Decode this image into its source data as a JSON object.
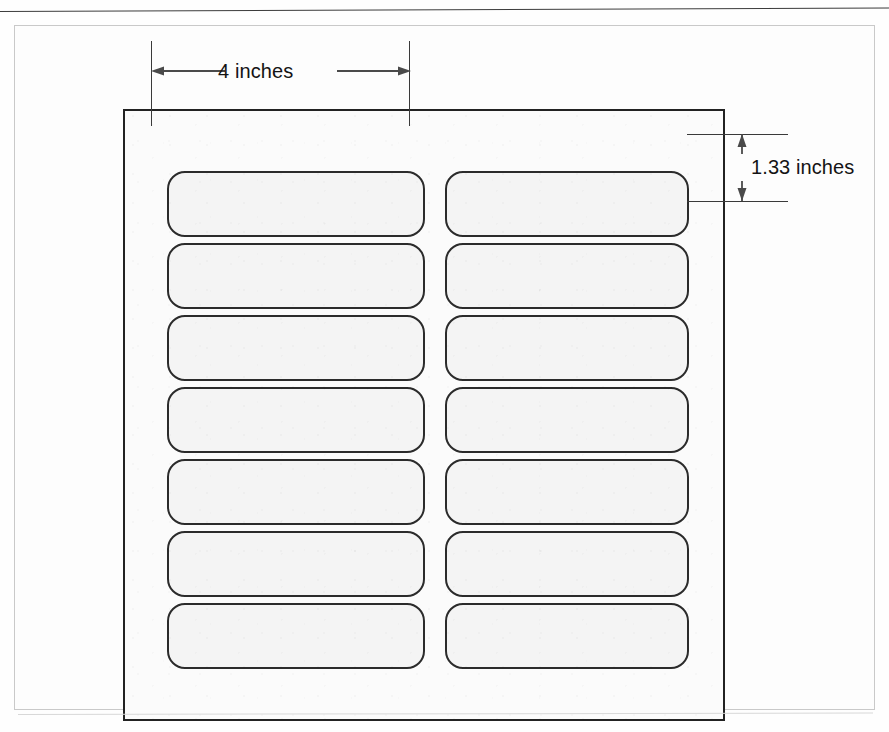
{
  "figure": {
    "kind": "label-sheet-dimension-diagram",
    "cropped_header_text": "",
    "sheet": {
      "columns": 2,
      "rows": 7,
      "total_labels": 14
    }
  },
  "dimensions": {
    "width": {
      "id": "label-width",
      "text": "4 inches",
      "value": 4,
      "unit": "inches",
      "orientation": "horizontal"
    },
    "height": {
      "id": "label-height",
      "text": "1.33 inches",
      "value": 1.33,
      "unit": "inches",
      "orientation": "vertical"
    }
  },
  "labels": [
    {
      "row": 1,
      "col": 1,
      "text": ""
    },
    {
      "row": 1,
      "col": 2,
      "text": ""
    },
    {
      "row": 2,
      "col": 1,
      "text": ""
    },
    {
      "row": 2,
      "col": 2,
      "text": ""
    },
    {
      "row": 3,
      "col": 1,
      "text": ""
    },
    {
      "row": 3,
      "col": 2,
      "text": ""
    },
    {
      "row": 4,
      "col": 1,
      "text": ""
    },
    {
      "row": 4,
      "col": 2,
      "text": ""
    },
    {
      "row": 5,
      "col": 1,
      "text": ""
    },
    {
      "row": 5,
      "col": 2,
      "text": ""
    },
    {
      "row": 6,
      "col": 1,
      "text": ""
    },
    {
      "row": 6,
      "col": 2,
      "text": ""
    },
    {
      "row": 7,
      "col": 1,
      "text": ""
    },
    {
      "row": 7,
      "col": 2,
      "text": ""
    }
  ],
  "geometry": {
    "columns_x": [
      42,
      320
    ],
    "column_width": 258,
    "column2_width": 244,
    "row_start_y": 60,
    "row_pitch": 72,
    "row_height": 66,
    "corner_radius": 18
  },
  "colors": {
    "label_fill": "#f4f4f4",
    "label_stroke": "#2b2b2b",
    "sheet_stroke": "#222222",
    "frame_stroke": "#c9c9c9",
    "dimension_stroke": "#4a4a4a",
    "text": "#141414",
    "page_background": "#fefefe"
  }
}
